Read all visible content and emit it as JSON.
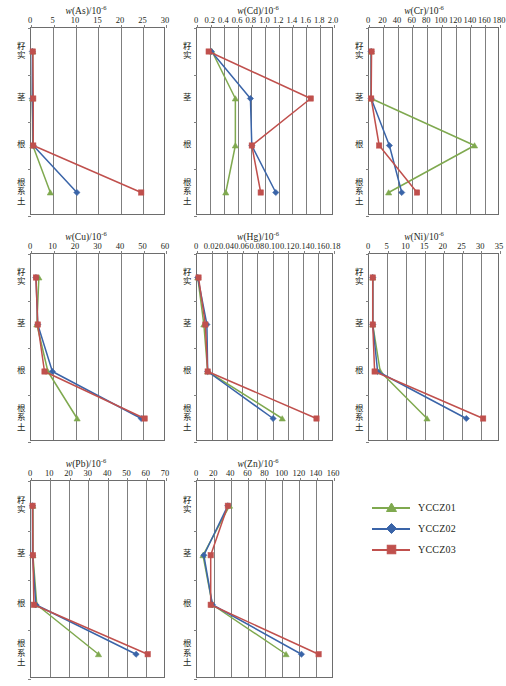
{
  "figure": {
    "width": 506,
    "height": 686,
    "categories": [
      "籽实",
      "茎",
      "根",
      "根系土"
    ],
    "series_names": [
      "YCCZ01",
      "YCCZ02",
      "YCCZ03"
    ],
    "colors": {
      "YCCZ01": "#7FA94F",
      "YCCZ02": "#3A64A8",
      "YCCZ03": "#C0504D",
      "grid": "#7f7f7f",
      "axis": "#6d6d6d",
      "text": "#231f20"
    }
  },
  "legend": {
    "position": "bottom-right",
    "items": [
      {
        "label": "YCCZ01",
        "color": "#7FA94F",
        "marker": "triangle"
      },
      {
        "label": "YCCZ02",
        "color": "#3A64A8",
        "marker": "diamond"
      },
      {
        "label": "YCCZ03",
        "color": "#C0504D",
        "marker": "square"
      }
    ]
  },
  "chart_data": [
    {
      "id": "as",
      "type": "line",
      "title_element": "As",
      "title_prefix": "w",
      "title_unit": "/10",
      "title_exponent": "-6",
      "title": "w(As) /10⁻⁶",
      "xlabel": "",
      "ylabel": "",
      "categories": [
        "籽实",
        "茎",
        "根",
        "根系土"
      ],
      "xlim": [
        0,
        30
      ],
      "xticks": [
        0,
        5,
        10,
        15,
        20,
        25,
        30
      ],
      "xtick_labels": [
        "0",
        "5",
        "10",
        "15",
        "20",
        "25",
        "30"
      ],
      "grid": true,
      "series": [
        {
          "name": "YCCZ01",
          "values": [
            0.4,
            0.3,
            0.4,
            4.3
          ]
        },
        {
          "name": "YCCZ02",
          "values": [
            0.3,
            0.3,
            0.5,
            10.2
          ]
        },
        {
          "name": "YCCZ03",
          "values": [
            0.4,
            0.5,
            0.5,
            24.5
          ]
        }
      ]
    },
    {
      "id": "cd",
      "type": "line",
      "title_element": "Cd",
      "title_prefix": "w",
      "title_unit": "/10",
      "title_exponent": "-6",
      "title": "w(Cd) /10⁻⁶",
      "xlabel": "",
      "ylabel": "",
      "categories": [
        "籽实",
        "茎",
        "根",
        "根系土"
      ],
      "xlim": [
        0,
        2.0
      ],
      "xticks": [
        0,
        0.2,
        0.4,
        0.6,
        0.8,
        1.0,
        1.2,
        1.4,
        1.6,
        1.8,
        2.0
      ],
      "xtick_labels": [
        "0",
        "0.2",
        "0.4",
        "0.6",
        "0.8",
        "1.0",
        "1.2",
        "1.4",
        "1.6",
        "1.8",
        "2.0"
      ],
      "grid": true,
      "series": [
        {
          "name": "YCCZ01",
          "values": [
            0.22,
            0.56,
            0.56,
            0.42
          ]
        },
        {
          "name": "YCCZ02",
          "values": [
            0.21,
            0.78,
            0.8,
            1.15
          ]
        },
        {
          "name": "YCCZ03",
          "values": [
            0.17,
            1.66,
            0.8,
            0.93
          ]
        }
      ]
    },
    {
      "id": "cr",
      "type": "line",
      "title_element": "Cr",
      "title_prefix": "w",
      "title_unit": "/10",
      "title_exponent": "-6",
      "title": "w(Cr) /10⁻⁶",
      "xlabel": "",
      "ylabel": "",
      "categories": [
        "籽实",
        "茎",
        "根",
        "根系土"
      ],
      "xlim": [
        0,
        180
      ],
      "xticks": [
        0,
        20,
        40,
        60,
        80,
        100,
        120,
        140,
        160,
        180
      ],
      "xtick_labels": [
        "0",
        "20",
        "40",
        "60",
        "80",
        "100",
        "120",
        "140",
        "160",
        "180"
      ],
      "grid": true,
      "series": [
        {
          "name": "YCCZ01",
          "values": [
            3.0,
            3.0,
            145.0,
            27.0
          ]
        },
        {
          "name": "YCCZ02",
          "values": [
            3.0,
            3.0,
            28.0,
            45.0
          ]
        },
        {
          "name": "YCCZ03",
          "values": [
            3.5,
            3.0,
            14.0,
            66.0
          ]
        }
      ]
    },
    {
      "id": "cu",
      "type": "line",
      "title_element": "Cu",
      "title_prefix": "w",
      "title_unit": "/10",
      "title_exponent": "-6",
      "title": "w(Cu) /10⁻⁶",
      "xlabel": "",
      "ylabel": "",
      "categories": [
        "籽实",
        "茎",
        "根",
        "根系土"
      ],
      "xlim": [
        0,
        60
      ],
      "xticks": [
        0,
        10,
        20,
        30,
        40,
        50,
        60
      ],
      "xtick_labels": [
        "0",
        "10",
        "20",
        "30",
        "40",
        "50",
        "60"
      ],
      "grid": true,
      "series": [
        {
          "name": "YCCZ01",
          "values": [
            3.5,
            2.6,
            7.5,
            20.5
          ]
        },
        {
          "name": "YCCZ02",
          "values": [
            2.2,
            3.0,
            9.5,
            49.0
          ]
        },
        {
          "name": "YCCZ03",
          "values": [
            2.2,
            3.0,
            6.0,
            50.5
          ]
        }
      ]
    },
    {
      "id": "hg",
      "type": "line",
      "title_element": "Hg",
      "title_prefix": "w",
      "title_unit": "/10",
      "title_exponent": "-6",
      "title": "w(Hg) /10⁻⁶",
      "xlabel": "",
      "ylabel": "",
      "categories": [
        "籽实",
        "茎",
        "根",
        "根系土"
      ],
      "xlim": [
        0,
        0.18
      ],
      "xticks": [
        0,
        0.02,
        0.04,
        0.06,
        0.08,
        0.1,
        0.12,
        0.14,
        0.16,
        0.18
      ],
      "xtick_labels": [
        "0",
        "0.02",
        "0.04",
        "0.06",
        "0.08",
        "0.10",
        "0.12",
        "0.14",
        "0.16",
        "0.18"
      ],
      "grid": true,
      "series": [
        {
          "name": "YCCZ01",
          "values": [
            0.001,
            0.009,
            0.014,
            0.112
          ]
        },
        {
          "name": "YCCZ02",
          "values": [
            0.001,
            0.013,
            0.014,
            0.1
          ]
        },
        {
          "name": "YCCZ03",
          "values": [
            0.002,
            0.011,
            0.014,
            0.157
          ]
        }
      ]
    },
    {
      "id": "ni",
      "type": "line",
      "title_element": "Ni",
      "title_prefix": "w",
      "title_unit": "/10",
      "title_exponent": "-6",
      "title": "w(Ni) /10⁻⁶",
      "xlabel": "",
      "ylabel": "",
      "categories": [
        "籽实",
        "茎",
        "根",
        "根系土"
      ],
      "xlim": [
        0,
        35
      ],
      "xticks": [
        0,
        5,
        10,
        15,
        20,
        25,
        30,
        35
      ],
      "xtick_labels": [
        "0",
        "5",
        "10",
        "15",
        "20",
        "25",
        "30",
        "35"
      ],
      "grid": true,
      "series": [
        {
          "name": "YCCZ01",
          "values": [
            1.0,
            1.0,
            3.0,
            15.5
          ]
        },
        {
          "name": "YCCZ02",
          "values": [
            1.0,
            1.0,
            2.3,
            26.0
          ]
        },
        {
          "name": "YCCZ03",
          "values": [
            1.0,
            1.0,
            1.5,
            30.5
          ]
        }
      ]
    },
    {
      "id": "pb",
      "type": "line",
      "title_element": "Pb",
      "title_prefix": "w",
      "title_unit": "/10",
      "title_exponent": "-6",
      "title": "w(Pb) /10⁻⁶",
      "xlabel": "",
      "ylabel": "",
      "categories": [
        "籽实",
        "茎",
        "根",
        "根系土"
      ],
      "xlim": [
        0,
        70
      ],
      "xticks": [
        0,
        10,
        20,
        30,
        40,
        50,
        60,
        70
      ],
      "xtick_labels": [
        "0",
        "10",
        "20",
        "30",
        "40",
        "50",
        "60",
        "70"
      ],
      "grid": true,
      "series": [
        {
          "name": "YCCZ01",
          "values": [
            1.0,
            1.0,
            3.0,
            35.0
          ]
        },
        {
          "name": "YCCZ02",
          "values": [
            0.8,
            0.8,
            2.5,
            54.5
          ]
        },
        {
          "name": "YCCZ03",
          "values": [
            0.8,
            1.0,
            1.5,
            60.5
          ]
        }
      ]
    },
    {
      "id": "zn",
      "type": "line",
      "title_element": "Zn",
      "title_prefix": "w",
      "title_unit": "/10",
      "title_exponent": "-6",
      "title": "w(Zn) /10⁻⁶",
      "xlabel": "",
      "ylabel": "",
      "categories": [
        "籽实",
        "茎",
        "根",
        "根系土"
      ],
      "xlim": [
        0,
        160
      ],
      "xticks": [
        0,
        20,
        40,
        60,
        80,
        100,
        120,
        140,
        160
      ],
      "xtick_labels": [
        "0",
        "20",
        "40",
        "60",
        "80",
        "100",
        "120",
        "140",
        "160"
      ],
      "grid": true,
      "series": [
        {
          "name": "YCCZ01",
          "values": [
            38.0,
            7.0,
            18.0,
            104.0
          ]
        },
        {
          "name": "YCCZ02",
          "values": [
            36.0,
            8.0,
            18.0,
            122.0
          ]
        },
        {
          "name": "YCCZ03",
          "values": [
            36.0,
            16.0,
            16.0,
            142.0
          ]
        }
      ]
    }
  ]
}
